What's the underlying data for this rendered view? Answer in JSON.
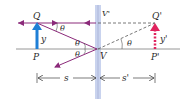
{
  "diagram": {
    "labels": {
      "object_top": "Q",
      "object_base": "P",
      "object_height": "y",
      "image_top": "Q'",
      "image_base": "P'",
      "image_height": "y'",
      "mirror_top": "V'",
      "vertex": "V",
      "angle": "θ",
      "object_distance": "s",
      "image_distance": "s'"
    },
    "colors": {
      "mirror": "#c9d3ee",
      "ray": "#8b2a7a",
      "object_arrow": "#1f7fd6",
      "image_arrow": "#e0245e",
      "axis": "#8a8a8a",
      "text": "#2a2a2a"
    }
  }
}
